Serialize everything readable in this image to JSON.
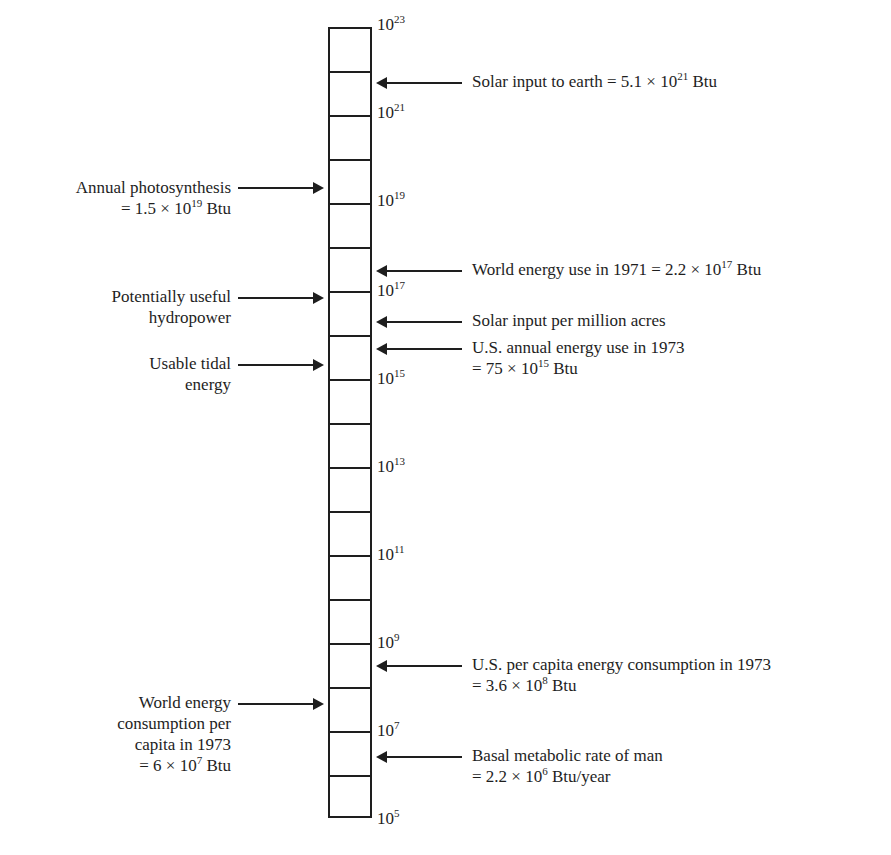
{
  "diagram": {
    "type": "logarithmic energy scale",
    "unit": "Btu",
    "scale": {
      "cells": 18,
      "top_exponent": 23,
      "bottom_exponent": 5,
      "ticks": [
        {
          "base": "10",
          "exp": "23"
        },
        {
          "base": "10",
          "exp": "21"
        },
        {
          "base": "10",
          "exp": "19"
        },
        {
          "base": "10",
          "exp": "17"
        },
        {
          "base": "10",
          "exp": "15"
        },
        {
          "base": "10",
          "exp": "13"
        },
        {
          "base": "10",
          "exp": "11"
        },
        {
          "base": "10",
          "exp": "9"
        },
        {
          "base": "10",
          "exp": "7"
        },
        {
          "base": "10",
          "exp": "5"
        }
      ]
    },
    "right_annotations": [
      {
        "line1": "Solar input to earth = 5.1 × 10",
        "sup1": "21",
        "tail1": " Btu"
      },
      {
        "line1": "World energy use in 1971 = 2.2 × 10",
        "sup1": "17",
        "tail1": " Btu"
      },
      {
        "line1": "Solar input per million acres"
      },
      {
        "line1": "U.S. annual energy use in 1973",
        "line2": "= 75 × 10",
        "sup2": "15",
        "tail2": " Btu"
      },
      {
        "line1": "U.S. per capita energy consumption in 1973",
        "line2": "= 3.6 × 10",
        "sup2": "8",
        "tail2": " Btu"
      },
      {
        "line1": "Basal metabolic rate of man",
        "line2": "= 2.2 × 10",
        "sup2": "6",
        "tail2": " Btu/year"
      }
    ],
    "left_annotations": [
      {
        "line1": "Annual photosynthesis",
        "line2": "= 1.5 × 10",
        "sup2": "19",
        "tail2": " Btu"
      },
      {
        "line1": "Potentially useful",
        "line2": "hydropower"
      },
      {
        "line1": "Usable tidal",
        "line2": "energy"
      },
      {
        "line1": "World energy",
        "line2": "consumption per",
        "line3": "capita in 1973",
        "line4": "= 6 × 10",
        "sup4": "7",
        "tail4": " Btu"
      }
    ]
  }
}
